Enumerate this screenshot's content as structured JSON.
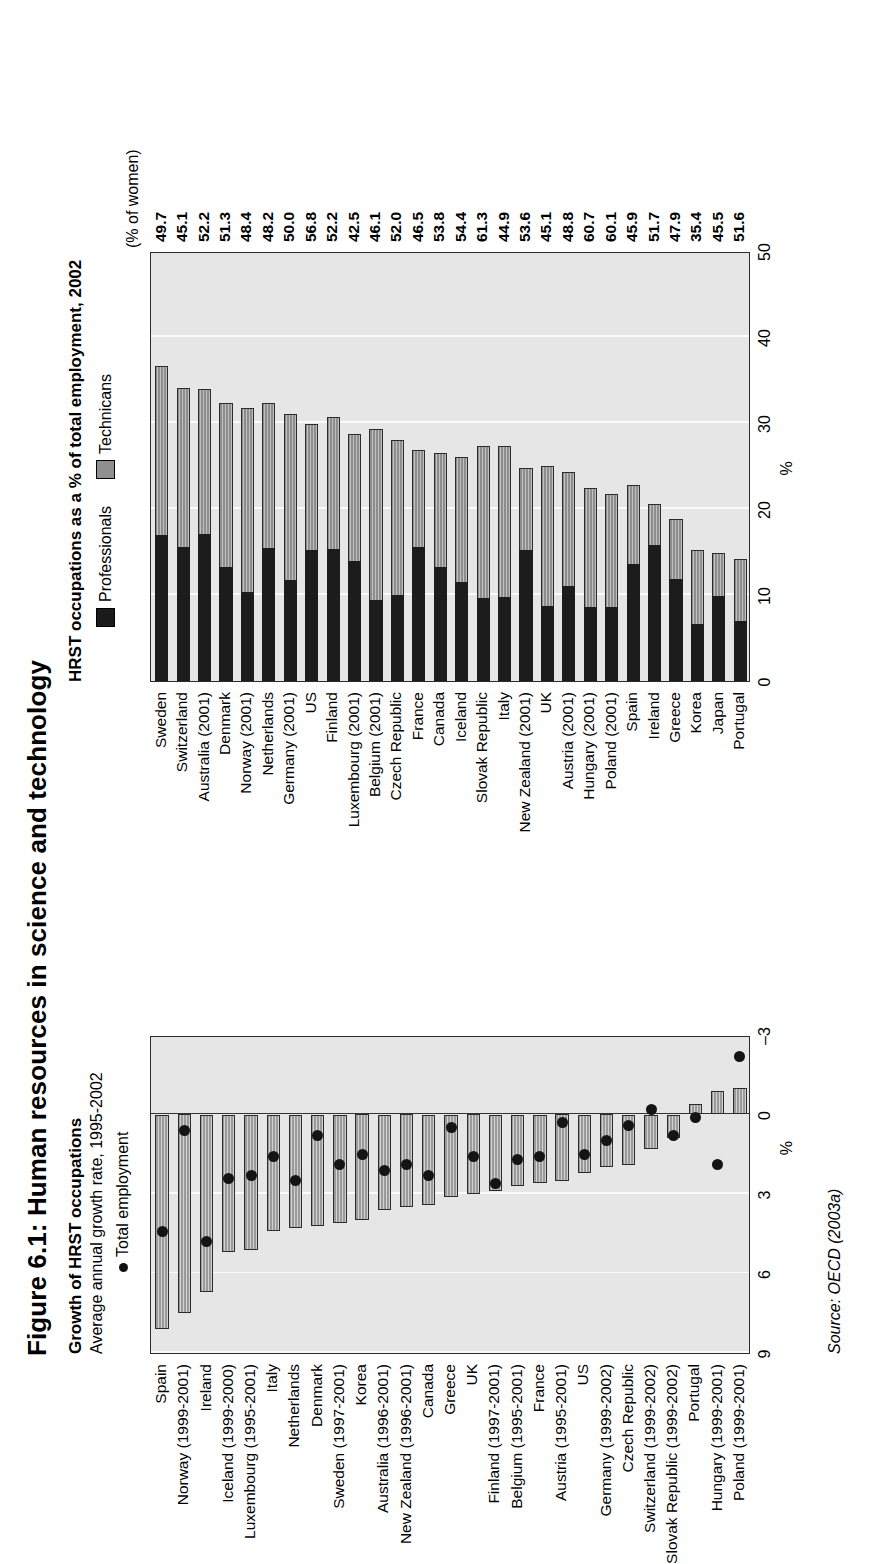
{
  "figure": {
    "title": "Figure 6.1: Human resources in science and technology",
    "source": "Source: OECD (2003a)"
  },
  "left_panel": {
    "heading": "Growth of HRST occupations",
    "subheading": "Average annual growth rate, 1995-2002",
    "legend_point": "Total employment",
    "axis_label": "%"
  },
  "right_panel": {
    "heading": "HRST occupations as a % of total employment, 2002",
    "legend_professionals": "Professionals",
    "legend_technicians": "Technicans",
    "axis_label": "%",
    "women_note": "(% of women)"
  },
  "chart_data": [
    {
      "type": "bar",
      "id": "growth-of-hrst-occupations",
      "title": "Growth of HRST occupations",
      "subtitle": "Average annual growth rate, 1995-2002",
      "xlabel": "%",
      "ylabel": "",
      "xlim": [
        9,
        -3
      ],
      "xticks": [
        9,
        6,
        3,
        0,
        -3
      ],
      "grid": true,
      "orientation": "horizontal",
      "legend": [
        "HRST occupations",
        "Total employment"
      ],
      "legend_position": "above",
      "categories": [
        "Spain",
        "Norway (1999-2001)",
        "Ireland",
        "Iceland (1999-2000)",
        "Luxembourg (1995-2001)",
        "Italy",
        "Netherlands",
        "Denmark",
        "Sweden (1997-2001)",
        "Korea",
        "Australia (1996-2001)",
        "New Zealand (1996-2001)",
        "Canada",
        "Greece",
        "UK",
        "Finland (1997-2001)",
        "Belgium (1995-2001)",
        "France",
        "Austria (1995-2001)",
        "US",
        "Germany (1999-2002)",
        "Czech Republic",
        "Switzerland (1999-2002)",
        "Slovak Republic (1999-2002)",
        "Portugal",
        "Hungary (1999-2001)",
        "Poland (1999-2001)"
      ],
      "series": [
        {
          "name": "HRST occupations",
          "type": "bar",
          "values": [
            8.1,
            7.5,
            6.7,
            5.2,
            5.1,
            4.4,
            4.3,
            4.2,
            4.1,
            4.0,
            3.6,
            3.5,
            3.4,
            3.1,
            3.0,
            2.9,
            2.7,
            2.6,
            2.5,
            2.2,
            2.0,
            1.9,
            1.3,
            0.9,
            -0.4,
            -0.9,
            -1.0
          ]
        },
        {
          "name": "Total employment",
          "type": "scatter",
          "values": [
            4.4,
            0.6,
            4.8,
            2.4,
            2.3,
            1.6,
            2.5,
            0.8,
            1.9,
            1.5,
            2.1,
            1.9,
            2.3,
            0.5,
            1.6,
            2.6,
            1.7,
            1.6,
            0.3,
            1.5,
            1.0,
            0.4,
            -0.2,
            0.8,
            0.1,
            1.9,
            -2.2
          ]
        }
      ]
    },
    {
      "type": "bar",
      "id": "hrst-occupations-share-2002",
      "title": "HRST occupations as a % of total employment, 2002",
      "xlabel": "%",
      "ylabel": "",
      "xlim": [
        0,
        50
      ],
      "xticks": [
        0,
        10,
        20,
        30,
        40,
        50
      ],
      "grid": true,
      "stacked": true,
      "orientation": "horizontal",
      "legend": [
        "Professionals",
        "Technicans"
      ],
      "legend_position": "above",
      "value_column_header": "(% of women)",
      "categories": [
        "Sweden",
        "Switzerland",
        "Australia (2001)",
        "Denmark",
        "Norway (2001)",
        "Netherlands",
        "Germany (2001)",
        "US",
        "Finland",
        "Luxembourg (2001)",
        "Belgium (2001)",
        "Czech Republic",
        "France",
        "Canada",
        "Iceland",
        "Slovak Republic",
        "Italy",
        "New Zealand (2001)",
        "UK",
        "Austria (2001)",
        "Hungary (2001)",
        "Poland (2001)",
        "Spain",
        "Ireland",
        "Greece",
        "Korea",
        "Japan",
        "Portugal"
      ],
      "series": [
        {
          "name": "Professionals",
          "values": [
            17.0,
            15.6,
            17.1,
            13.2,
            10.3,
            15.5,
            11.8,
            15.2,
            15.4,
            13.9,
            9.4,
            10.0,
            15.6,
            13.3,
            11.5,
            9.6,
            9.8,
            15.2,
            8.7,
            11.1,
            8.6,
            8.6,
            13.6,
            15.8,
            11.9,
            6.6,
            9.9,
            7.0
          ]
        },
        {
          "name": "Technicans",
          "values": [
            19.6,
            18.5,
            16.9,
            19.1,
            21.4,
            16.8,
            19.2,
            14.7,
            15.3,
            14.8,
            19.9,
            18.0,
            11.3,
            13.2,
            14.6,
            17.7,
            17.5,
            9.6,
            16.3,
            13.2,
            13.9,
            13.2,
            9.2,
            4.8,
            6.9,
            8.6,
            5.0,
            7.2
          ]
        }
      ],
      "women_values": [
        49.7,
        45.1,
        52.2,
        51.3,
        48.4,
        48.2,
        50.0,
        56.8,
        52.2,
        42.5,
        46.1,
        52.0,
        46.5,
        53.8,
        54.4,
        61.3,
        44.9,
        53.6,
        45.1,
        48.8,
        60.7,
        60.1,
        45.9,
        51.7,
        47.9,
        35.4,
        45.5,
        51.6
      ]
    }
  ]
}
